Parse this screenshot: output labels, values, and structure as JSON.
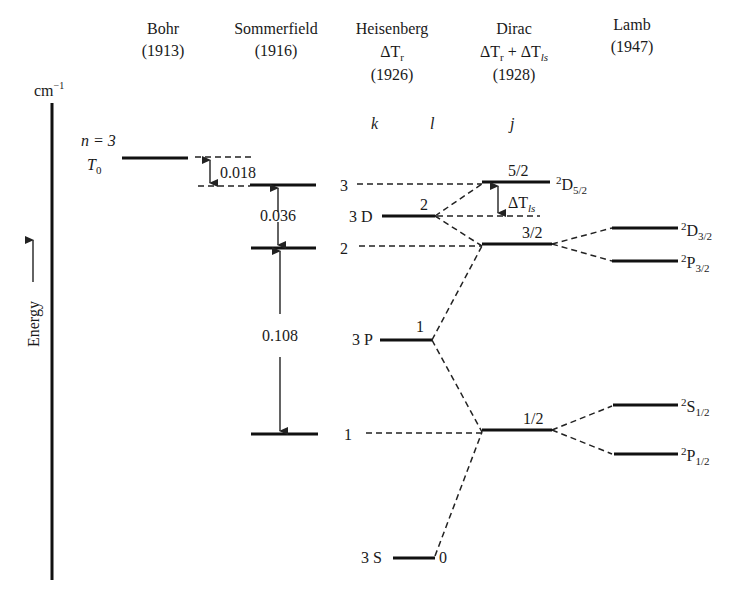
{
  "columns": [
    {
      "name": "Bohr",
      "sub": [],
      "year": "(1913)"
    },
    {
      "name": "Sommerfield",
      "sub": [],
      "year": "(1916)"
    },
    {
      "name": "Heisenberg",
      "sub": [
        "ΔT",
        "r"
      ],
      "year": "(1926)"
    },
    {
      "name": "Dirac",
      "sub": [
        "ΔT",
        "r",
        " + ΔT",
        "ls"
      ],
      "year": "(1928)"
    },
    {
      "name": "Lamb",
      "sub": [],
      "year": "(1947)"
    }
  ],
  "axis": {
    "unit": "cm",
    "unit_exp": "−1",
    "label": "Energy"
  },
  "quantum_labels": {
    "k": "k",
    "l": "l",
    "j": "j"
  },
  "bohr": {
    "n_label": "n = 3",
    "t_label": "T",
    "t_sub": "0"
  },
  "sommerfeld": {
    "gaps": [
      {
        "value": "0.018",
        "between": [
          "T0",
          "k=3"
        ]
      },
      {
        "value": "0.036",
        "between": [
          "k=3",
          "k=2"
        ]
      },
      {
        "value": "0.108",
        "between": [
          "k=2",
          "k=1"
        ]
      }
    ],
    "k_labels": [
      "3",
      "2",
      "1"
    ]
  },
  "heisenberg": {
    "levels": [
      {
        "term": "3 D",
        "l": "2"
      },
      {
        "term": "3 P",
        "l": "1"
      },
      {
        "term": "3 S",
        "l": "0"
      }
    ]
  },
  "dirac": {
    "levels": [
      {
        "j": "5/2",
        "term": "D",
        "sup": "2",
        "sub": "5/2"
      },
      {
        "j": "3/2"
      },
      {
        "j": "1/2"
      }
    ],
    "delta_label": "ΔT",
    "delta_sub": "ls"
  },
  "lamb": {
    "levels": [
      {
        "sup": "2",
        "term": "D",
        "sub": "3/2"
      },
      {
        "sup": "2",
        "term": "P",
        "sub": "3/2"
      },
      {
        "sup": "2",
        "term": "S",
        "sub": "1/2"
      },
      {
        "sup": "2",
        "term": "P",
        "sub": "1/2"
      }
    ]
  }
}
